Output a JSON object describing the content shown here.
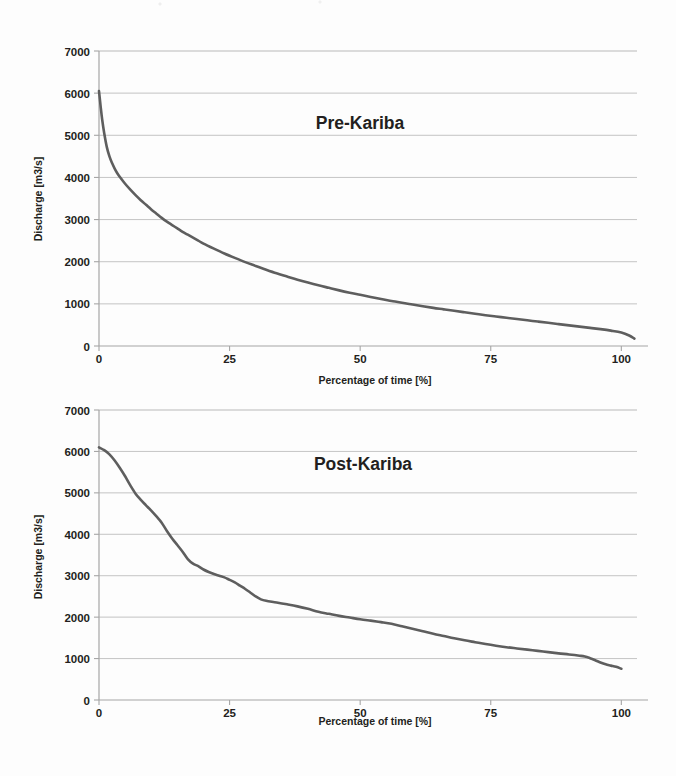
{
  "figure": {
    "background_color": "#fdfdfd",
    "series_color": "#5e5e5e",
    "gridline_color": "#b9b9b9",
    "axis_color": "#a6a6a6",
    "text_color": "#231f20",
    "panels": [
      "pre_kariba",
      "post_kariba"
    ]
  },
  "chart_data": [
    {
      "type": "line",
      "title": "Pre-Kariba",
      "xlabel": "Percentage of time [%]",
      "ylabel": "Discharge [m3/s]",
      "xlim": [
        0,
        103
      ],
      "ylim": [
        0,
        7000
      ],
      "xticks": [
        0,
        25,
        50,
        75,
        100
      ],
      "yticks": [
        0,
        1000,
        2000,
        3000,
        4000,
        5000,
        6000,
        7000
      ],
      "xtick_labels": [
        "0",
        "25",
        "50",
        "75",
        "100"
      ],
      "ytick_labels": [
        "0",
        "1000",
        "2000",
        "3000",
        "4000",
        "5000",
        "6000",
        "7000"
      ],
      "grid": "horizontal",
      "legend": "none",
      "series": [
        {
          "name": "Pre-Kariba flow duration curve",
          "x": [
            0,
            0.3,
            0.6,
            1,
            1.5,
            2,
            2.5,
            3,
            3.5,
            4,
            5,
            6,
            7,
            8,
            9,
            10,
            11,
            12,
            13,
            14,
            15,
            16,
            17,
            18,
            19,
            20,
            22,
            24,
            26,
            28,
            30,
            32,
            34,
            36,
            38,
            40,
            42,
            44,
            46,
            48,
            50,
            52,
            54,
            56,
            58,
            60,
            62,
            64,
            66,
            68,
            70,
            72,
            74,
            76,
            78,
            80,
            82,
            84,
            86,
            88,
            90,
            92,
            94,
            96,
            98,
            100,
            101.5,
            102.5
          ],
          "y": [
            6050,
            5700,
            5380,
            5050,
            4720,
            4500,
            4340,
            4210,
            4100,
            4010,
            3850,
            3710,
            3580,
            3460,
            3350,
            3240,
            3140,
            3040,
            2950,
            2870,
            2790,
            2710,
            2640,
            2570,
            2500,
            2430,
            2310,
            2195,
            2090,
            1990,
            1900,
            1810,
            1725,
            1650,
            1575,
            1505,
            1440,
            1380,
            1320,
            1265,
            1215,
            1165,
            1115,
            1070,
            1025,
            985,
            945,
            905,
            870,
            835,
            800,
            765,
            730,
            700,
            670,
            640,
            610,
            580,
            550,
            520,
            490,
            460,
            430,
            400,
            365,
            320,
            250,
            175
          ]
        }
      ]
    },
    {
      "type": "line",
      "title": "Post-Kariba",
      "xlabel": "Percentage of time [%]",
      "ylabel": "Discharge [m3/s]",
      "xlim": [
        0,
        103
      ],
      "ylim": [
        0,
        7000
      ],
      "xticks": [
        0,
        25,
        50,
        75,
        100
      ],
      "yticks": [
        0,
        1000,
        2000,
        3000,
        4000,
        5000,
        6000,
        7000
      ],
      "xtick_labels": [
        "0",
        "25",
        "50",
        "75",
        "100"
      ],
      "ytick_labels": [
        "0",
        "1000",
        "2000",
        "3000",
        "4000",
        "5000",
        "6000",
        "7000"
      ],
      "grid": "horizontal",
      "legend": "none",
      "series": [
        {
          "name": "Post-Kariba flow duration curve",
          "x": [
            0,
            1,
            2,
            3,
            4,
            5,
            6,
            7,
            8,
            9,
            10,
            11,
            12,
            13,
            14,
            15,
            16,
            17,
            18,
            19,
            20,
            21,
            22,
            23,
            24,
            25,
            26,
            27,
            28,
            29,
            30,
            31,
            32,
            34,
            36,
            38,
            40,
            42,
            44,
            46,
            48,
            50,
            52,
            54,
            56,
            58,
            60,
            62,
            64,
            66,
            68,
            70,
            72,
            74,
            76,
            78,
            80,
            82,
            84,
            86,
            88,
            90,
            92,
            93,
            94,
            95,
            96,
            97,
            98,
            99,
            100
          ],
          "y": [
            6100,
            6030,
            5930,
            5780,
            5600,
            5400,
            5180,
            4980,
            4830,
            4700,
            4570,
            4430,
            4280,
            4080,
            3900,
            3740,
            3580,
            3400,
            3290,
            3230,
            3150,
            3090,
            3040,
            3000,
            2960,
            2900,
            2840,
            2760,
            2680,
            2590,
            2500,
            2430,
            2395,
            2355,
            2310,
            2260,
            2200,
            2130,
            2080,
            2030,
            1990,
            1950,
            1915,
            1880,
            1840,
            1780,
            1720,
            1660,
            1600,
            1545,
            1490,
            1440,
            1395,
            1350,
            1310,
            1275,
            1245,
            1215,
            1185,
            1155,
            1125,
            1100,
            1070,
            1050,
            1010,
            960,
            905,
            860,
            830,
            800,
            755
          ]
        }
      ]
    }
  ]
}
